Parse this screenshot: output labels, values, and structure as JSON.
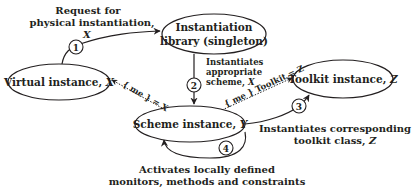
{
  "diagram": {
    "colors": {
      "stroke": "#231f20",
      "background": "#ffffff",
      "text": "#231f20"
    },
    "nodes": {
      "library": {
        "line1": "Instantiation",
        "line2": "library (singleton)"
      },
      "virtual": {
        "label": "Virtual instance, ",
        "var": "X"
      },
      "scheme": {
        "label": "Scheme instance, ",
        "var": "Y"
      },
      "toolkit": {
        "label": "Toolkit instance, ",
        "var": "Z"
      }
    },
    "steps": [
      "1",
      "2",
      "3",
      "4"
    ],
    "annotations": {
      "request": {
        "line1": "Request for",
        "line2": "physical instantiation,",
        "line3": "X"
      },
      "instantiates_scheme": {
        "line1": "Instantiates",
        "line2": "appropriate",
        "line3": "scheme, ",
        "var": "X"
      },
      "instantiates_toolkit": {
        "line1": "Instantiates corresponding",
        "line2": "toolkit class, ",
        "var": "Z"
      },
      "activates": {
        "line1": "Activates locally defined",
        "line2": "monitors, methods and constraints"
      }
    },
    "edge_labels": {
      "me_virtual": "{ me } = X",
      "me_toolkit": "{ me } Toolkit = Z"
    }
  }
}
